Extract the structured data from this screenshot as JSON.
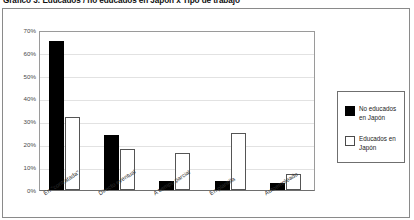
{
  "chart_data": {
    "type": "bar",
    "title": "Gráfico 3: Educados / no educados en Japón x Tipo de trabajo",
    "xlabel": "",
    "ylabel": "",
    "ylim": [
      0,
      70
    ],
    "grid": true,
    "legend_position": "right",
    "categories": [
      "En \"contratada\"",
      "Directo eventual",
      "A tiempo parcial",
      "En plantilla",
      "Autoempleado"
    ],
    "ytick_labels": [
      "0%",
      "10%",
      "20%",
      "30%",
      "40%",
      "50%",
      "60%",
      "70%"
    ],
    "ytick_values": [
      0,
      10,
      20,
      30,
      40,
      50,
      60,
      70
    ],
    "series": [
      {
        "name": "No educados en Japón",
        "color": "#000000",
        "style": "filled",
        "values": [
          65,
          24,
          4,
          4,
          3
        ]
      },
      {
        "name": "Educados en Japón",
        "color": "#ffffff",
        "style": "outlined",
        "values": [
          32,
          18,
          16,
          25,
          7
        ]
      }
    ]
  },
  "legend": {
    "entries": [
      {
        "label": "No educados en Japón",
        "swatch": "filled-black-square"
      },
      {
        "label": "Educados en Japón",
        "swatch": "outlined-white-square"
      }
    ]
  }
}
